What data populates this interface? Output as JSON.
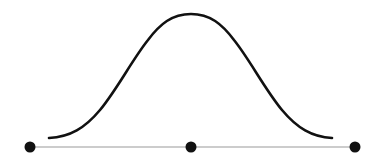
{
  "diagram": {
    "type": "bell-curve",
    "colors": {
      "curve": "#111111",
      "baseline": "#9a9a9a",
      "points": "#111111",
      "background": "#ffffff"
    },
    "curve": {
      "start": [
        49,
        138
      ],
      "peak": [
        191,
        14
      ],
      "end": [
        332,
        138
      ]
    },
    "baseline": {
      "y": 147,
      "x_start": 30,
      "x_end": 355
    },
    "points": [
      {
        "name": "left",
        "x": 30,
        "y": 147
      },
      {
        "name": "center",
        "x": 191,
        "y": 147
      },
      {
        "name": "right",
        "x": 355,
        "y": 147
      }
    ]
  }
}
